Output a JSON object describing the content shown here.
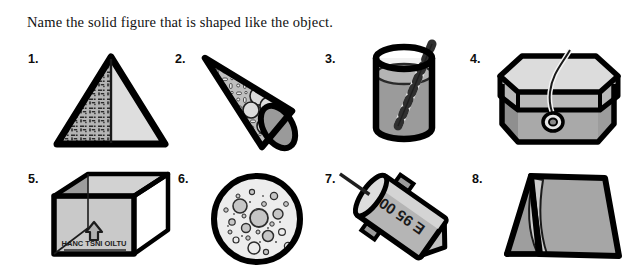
{
  "page": {
    "title": "Name the solid figure that is shaped like the object.",
    "background_color": "#ffffff",
    "ink_color": "#000000"
  },
  "palette": {
    "outline": "#000000",
    "light_gray": "#d8d8d8",
    "mid_gray": "#a8a8a8",
    "dark_gray": "#7d7d7d",
    "shade_gray": "#bcbcbc",
    "white": "#ffffff"
  },
  "exercises": [
    {
      "number": "1.",
      "object": "pyramid",
      "icon": "pyramid-icon",
      "answer_shape": "square pyramid",
      "detail_text": ""
    },
    {
      "number": "2.",
      "object": "ice cream cone",
      "icon": "cone-icon",
      "answer_shape": "cone",
      "detail_text": ""
    },
    {
      "number": "3.",
      "object": "drinking glass with straw",
      "icon": "glass-cylinder-icon",
      "answer_shape": "cylinder",
      "detail_text": ""
    },
    {
      "number": "4.",
      "object": "hexagonal hat box",
      "icon": "hexagonal-box-icon",
      "answer_shape": "hexagonal prism",
      "detail_text": ""
    },
    {
      "number": "5.",
      "object": "cardboard carton",
      "icon": "cardboard-box-icon",
      "answer_shape": "rectangular prism",
      "detail_text": "HANC  TSNI  OILTU"
    },
    {
      "number": "6.",
      "object": "moon",
      "icon": "moon-sphere-icon",
      "answer_shape": "sphere",
      "detail_text": ""
    },
    {
      "number": "7.",
      "object": "rocket firework",
      "icon": "rocket-icon",
      "answer_shape": "cylinder",
      "detail_text": "E 95 00"
    },
    {
      "number": "8.",
      "object": "tent",
      "icon": "tent-icon",
      "answer_shape": "triangular prism",
      "detail_text": ""
    }
  ]
}
